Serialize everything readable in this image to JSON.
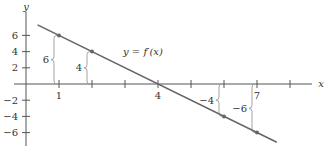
{
  "chart_data": {
    "type": "line",
    "title": "",
    "xlabel": "x",
    "ylabel": "y",
    "xlim": [
      0,
      8.8
    ],
    "ylim": [
      -7.5,
      8.2
    ],
    "x_ticks": [
      1,
      2,
      3,
      4,
      5,
      6,
      7,
      8
    ],
    "x_tick_labels": [
      {
        "value": 1,
        "label": "1"
      },
      {
        "value": 4,
        "label": "4"
      },
      {
        "value": 7,
        "label": "7"
      }
    ],
    "y_ticks": [
      6,
      4,
      2,
      -2,
      -4,
      -6
    ],
    "y_tick_labels": [
      "6",
      "4",
      "2",
      "−2",
      "−4",
      "−6"
    ],
    "series": [
      {
        "name": "y = f′(x)",
        "equation": "y = 8 - 2x",
        "x_range": [
          0.35,
          7.6
        ],
        "points": [
          [
            1,
            6
          ],
          [
            2,
            4
          ],
          [
            6,
            -4
          ],
          [
            7,
            -6
          ]
        ]
      }
    ],
    "annotations": [
      {
        "x": 1,
        "y": 6,
        "label": "6"
      },
      {
        "x": 2,
        "y": 4,
        "label": "4"
      },
      {
        "x": 6,
        "y": -4,
        "label": "−4"
      },
      {
        "x": 7,
        "y": -6,
        "label": "−6"
      }
    ],
    "curve_label": {
      "prefix": "y = ",
      "func": "f′(x)",
      "x": 3.0,
      "y": 4.0
    },
    "grid": false,
    "legend": "none"
  }
}
